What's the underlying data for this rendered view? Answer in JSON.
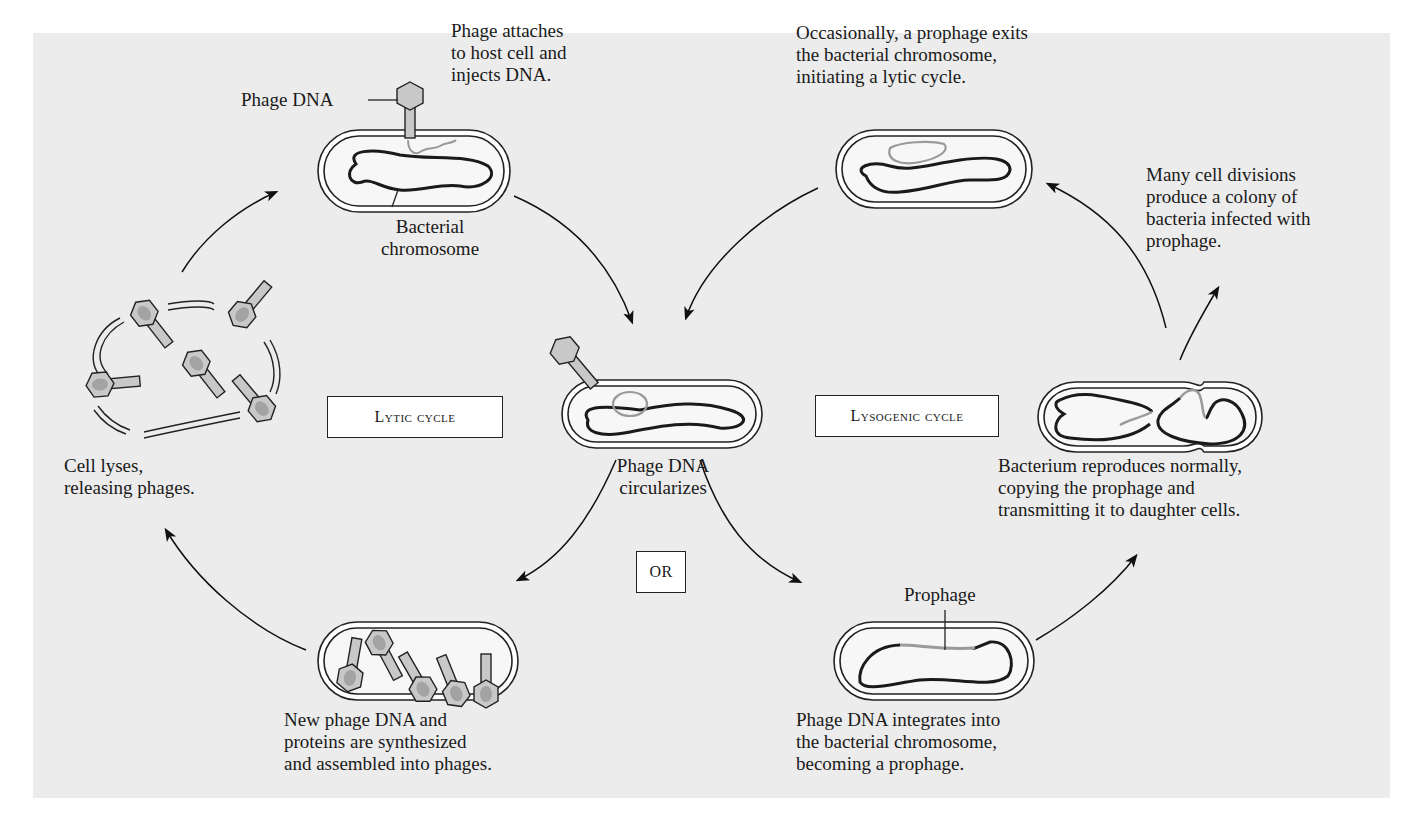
{
  "figure": {
    "background_color": "#ececec",
    "dna_color": "#1a1a1a",
    "phage_dna_color": "#9a9a9a",
    "phage_fill": "#c8c8c8"
  },
  "cycle_labels": {
    "lytic": "Lytic cycle",
    "lysogenic": "Lysogenic cycle",
    "or": "OR"
  },
  "captions": {
    "attach": "Phage attaches\nto host cell and\ninjects DNA.",
    "phage_dna": "Phage DNA",
    "bacterial_chromosome": "Bacterial\nchromosome",
    "circularizes": "Phage DNA\ncircularizes",
    "lyses": "Cell lyses,\nreleasing phages.",
    "synthesized": "New phage DNA and\nproteins are synthesized\nand assembled into phages.",
    "integrates": "Phage DNA integrates into\nthe bacterial chromosome,\nbecoming a prophage.",
    "prophage": "Prophage",
    "reproduces": "Bacterium reproduces normally,\ncopying the prophage and\ntransmitting it to daughter cells.",
    "divisions": "Many cell divisions\nproduce a colony of\nbacteria infected with\nprophage.",
    "exits": "Occasionally, a prophage exits\nthe bacterial chromosome,\ninitiating a lytic cycle."
  }
}
